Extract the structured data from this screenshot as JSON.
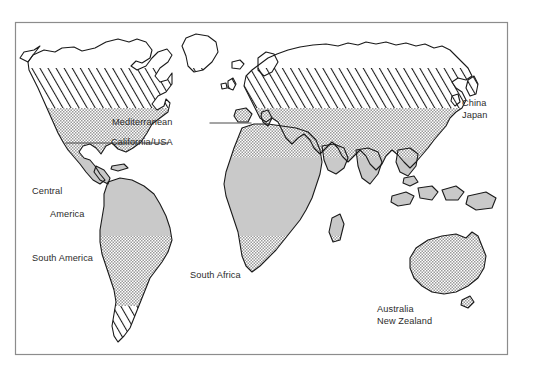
{
  "figure": {
    "kind": "world-map",
    "frame": {
      "x": 15,
      "y": 22,
      "width": 493,
      "height": 333,
      "border_color": "#8c8c8c",
      "background": "#ffffff"
    },
    "palette": {
      "outline": "#1a1a1a",
      "land_fill": "#ffffff",
      "solid_grey": "#c9c9c9",
      "dotted_grey": "#bdbdbd",
      "hatch_line": "#1a1a1a",
      "label_text": "#2b2b2b",
      "leader_line": "#4a4a4a"
    },
    "shading_zones": [
      {
        "name": "hatched-band",
        "pattern": "diagonal-hatch",
        "y_top": 68,
        "y_bottom": 108
      },
      {
        "name": "dotted-band",
        "pattern": "stipple-dots",
        "y_top": 108,
        "y_bottom": 158
      },
      {
        "name": "solid-band",
        "pattern": "solid-grey",
        "y_top": 158,
        "y_bottom": 355
      }
    ]
  },
  "labels": {
    "mediterranean": "Mediterranean",
    "california_usa": "California/USA",
    "china": "China",
    "japan": "Japan",
    "central_america_line1": "Central",
    "central_america_line2": "America",
    "south_america": "South America",
    "south_africa": "South Africa",
    "australia": "Australia",
    "new_zealand": "New Zealand"
  },
  "leader_lines": [
    {
      "name": "mediterranean-leader",
      "x1": 210,
      "y1": 123,
      "x2": 251,
      "y2": 123
    },
    {
      "name": "california-leader",
      "x1": 66,
      "y1": 143,
      "x2": 168,
      "y2": 143
    }
  ]
}
